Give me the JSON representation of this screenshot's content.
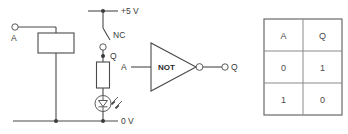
{
  "figure": {
    "circuit": {
      "name": "relay-not-circuit",
      "input_terminal_label": "A",
      "supply_rail_label": "+5 V",
      "ground_rail_label": "0 V",
      "contact_label": "NC",
      "output_node_label": "Q",
      "components": {
        "coil": "relay-coil",
        "contact": "normally-closed-contact",
        "resistor": "series-resistor",
        "led": "led-indicator"
      }
    },
    "logic_symbol": {
      "name": "not-gate-symbol",
      "gate_label": "NOT",
      "input_label": "A",
      "output_label": "Q"
    },
    "truth_table": {
      "name": "not-gate-truth-table",
      "headers": [
        "A",
        "Q"
      ],
      "rows": [
        [
          "0",
          "1"
        ],
        [
          "1",
          "0"
        ]
      ]
    },
    "colors": {
      "line": "#4a4a4a",
      "text": "#3a3a3a",
      "grid": "#8a8a8a",
      "background": "#ffffff"
    }
  }
}
